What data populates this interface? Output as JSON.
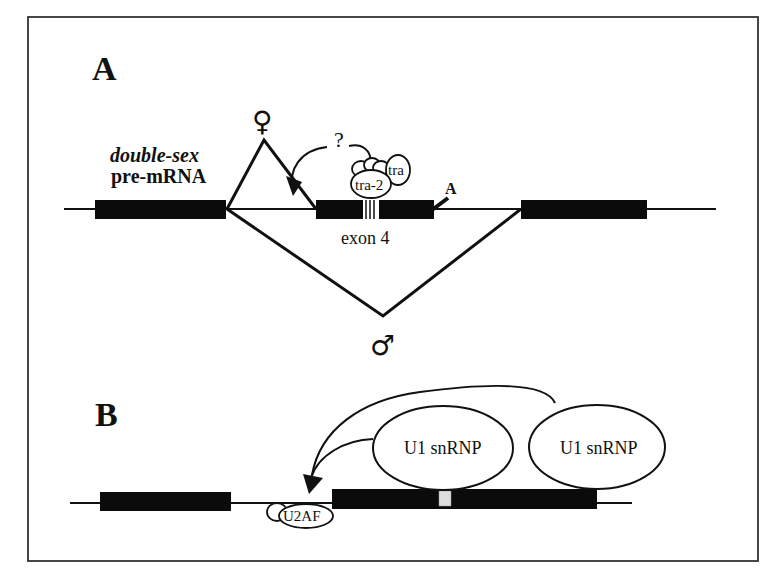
{
  "figure": {
    "frame_color": "#333333",
    "panels": [
      {
        "label": "A",
        "gene_name": "double-sex",
        "transcript_type": "pre-mRNA",
        "exon_label": "exon 4",
        "female_symbol": "♀",
        "male_symbol": "♂",
        "question_mark": "?",
        "proteins": [
          "tra-2",
          "tra"
        ],
        "site_marker": "A"
      },
      {
        "label": "B",
        "proteins": [
          "U1 snRNP",
          "U1 snRNP",
          "U2AF"
        ]
      }
    ]
  }
}
